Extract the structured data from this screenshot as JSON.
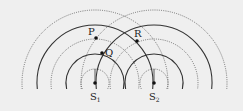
{
  "diagram": {
    "sources": [
      {
        "id": "S1",
        "label": "S",
        "subscript": "1",
        "x": 95,
        "y": 83
      },
      {
        "id": "S2",
        "label": "S",
        "subscript": "2",
        "x": 154,
        "y": 83
      }
    ],
    "points": [
      {
        "id": "P",
        "label": "P",
        "x": 96,
        "y": 38,
        "label_x": 88,
        "label_y": 35
      },
      {
        "id": "Q",
        "label": "Q",
        "x": 102,
        "y": 53,
        "label_x": 105,
        "label_y": 55
      },
      {
        "id": "R",
        "label": "R",
        "x": 137,
        "y": 41,
        "label_x": 134,
        "label_y": 37
      }
    ],
    "arcs": [
      {
        "r": 14,
        "style": "dotted"
      },
      {
        "r": 29,
        "style": "solid"
      },
      {
        "r": 44,
        "style": "dotted"
      },
      {
        "r": 58,
        "style": "solid"
      },
      {
        "r": 73,
        "style": "dotted"
      }
    ],
    "baseline_y": 89,
    "colors": {
      "solid": "#333333",
      "dotted": "#555555",
      "background": "#efefef"
    }
  }
}
